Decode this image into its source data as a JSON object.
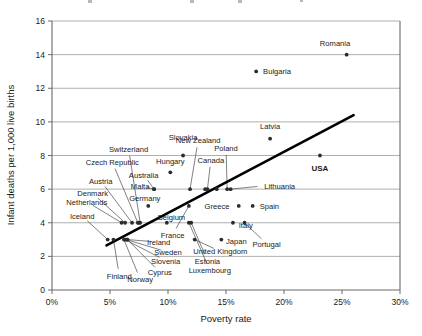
{
  "chart_data": {
    "type": "scatter",
    "title": "",
    "xlabel": "Poverty rate",
    "ylabel": "Infant deaths per 1,000 live births",
    "xlim": [
      0,
      30
    ],
    "ylim": [
      0,
      16
    ],
    "xticks": [
      "0%",
      "5%",
      "10%",
      "15%",
      "20%",
      "25%",
      "30%"
    ],
    "xtick_values": [
      0,
      5,
      10,
      15,
      20,
      25,
      30
    ],
    "yticks": [
      "0",
      "2",
      "4",
      "6",
      "8",
      "10",
      "12",
      "14",
      "16"
    ],
    "ytick_values": [
      0,
      2,
      4,
      6,
      8,
      10,
      12,
      14,
      16
    ],
    "grid": "horizontal",
    "legend": "none",
    "trendline": {
      "x0": 4.7,
      "y0": 2.65,
      "x1": 26.0,
      "y1": 10.4
    },
    "points": [
      {
        "label": "Romania",
        "x": 25.4,
        "y": 14,
        "lx": 24.4,
        "ly": 14.7,
        "anchor": "middle",
        "leader": false,
        "bold": false
      },
      {
        "label": "Bulgaria",
        "x": 17.6,
        "y": 13,
        "lx": 18.2,
        "ly": 13.0,
        "anchor": "start",
        "leader": false,
        "bold": false
      },
      {
        "label": "Latvia",
        "x": 18.8,
        "y": 9,
        "lx": 18.8,
        "ly": 9.75,
        "anchor": "middle",
        "leader": false,
        "bold": false
      },
      {
        "label": "USA",
        "x": 23.1,
        "y": 8,
        "lx": 23.1,
        "ly": 7.25,
        "anchor": "middle",
        "leader": false,
        "bold": true
      },
      {
        "label": "Slovakia",
        "x": 11.3,
        "y": 8,
        "lx": 11.3,
        "ly": 9.1,
        "anchor": "middle",
        "leader": false,
        "bold": false
      },
      {
        "label": "Hungary",
        "x": 10.2,
        "y": 7,
        "lx": 10.2,
        "ly": 7.7,
        "anchor": "middle",
        "leader": false,
        "bold": false
      },
      {
        "label": "Switzerland",
        "x": 7.6,
        "y": 4,
        "lx": 6.6,
        "ly": 8.4,
        "anchor": "middle",
        "leader": true,
        "bold": false
      },
      {
        "label": "New Zealand",
        "x": 11.9,
        "y": 6,
        "lx": 12.6,
        "ly": 8.9,
        "anchor": "middle",
        "leader": true,
        "bold": false
      },
      {
        "label": "Canada",
        "x": 13.4,
        "y": 6,
        "lx": 13.7,
        "ly": 7.75,
        "anchor": "middle",
        "leader": true,
        "bold": false
      },
      {
        "label": "Poland",
        "x": 15.1,
        "y": 6,
        "lx": 15.0,
        "ly": 8.45,
        "anchor": "middle",
        "leader": true,
        "bold": false
      },
      {
        "label": "Czech Republic",
        "x": 7.4,
        "y": 4,
        "lx": 5.2,
        "ly": 7.6,
        "anchor": "middle",
        "leader": true,
        "bold": false
      },
      {
        "label": "Australia",
        "x": 8.8,
        "y": 6,
        "lx": 7.9,
        "ly": 6.85,
        "anchor": "middle",
        "leader": true,
        "bold": false
      },
      {
        "label": "Malta",
        "x": 8.8,
        "y": 6,
        "lx": 7.6,
        "ly": 6.2,
        "anchor": "middle",
        "leader": true,
        "bold": false
      },
      {
        "label": "Austria",
        "x": 6.9,
        "y": 4,
        "lx": 4.2,
        "ly": 6.5,
        "anchor": "middle",
        "leader": true,
        "bold": false
      },
      {
        "label": "Germany",
        "x": 8.3,
        "y": 5,
        "lx": 8.0,
        "ly": 5.45,
        "anchor": "middle",
        "leader": true,
        "bold": false
      },
      {
        "label": "Denmark",
        "x": 6.3,
        "y": 4,
        "lx": 3.5,
        "ly": 5.75,
        "anchor": "middle",
        "leader": true,
        "bold": false
      },
      {
        "label": "Netherlands",
        "x": 6.0,
        "y": 4,
        "lx": 3.0,
        "ly": 5.25,
        "anchor": "middle",
        "leader": true,
        "bold": false
      },
      {
        "label": "Lithuania",
        "x": 15.4,
        "y": 6,
        "lx": 18.3,
        "ly": 6.2,
        "anchor": "start",
        "leader": true,
        "bold": false
      },
      {
        "label": "Iceland",
        "x": 4.8,
        "y": 3,
        "lx": 2.6,
        "ly": 4.4,
        "anchor": "middle",
        "leader": true,
        "bold": false
      },
      {
        "label": "Belgium",
        "x": 9.9,
        "y": 4,
        "lx": 10.3,
        "ly": 4.35,
        "anchor": "middle",
        "leader": true,
        "bold": false
      },
      {
        "label": "Greece",
        "x": 16.1,
        "y": 5,
        "lx": 15.3,
        "ly": 5.0,
        "anchor": "end",
        "leader": false,
        "bold": false
      },
      {
        "label": "Spain",
        "x": 17.3,
        "y": 5,
        "lx": 17.9,
        "ly": 5.0,
        "anchor": "start",
        "leader": false,
        "bold": false
      },
      {
        "label": "France",
        "x": 11.8,
        "y": 5,
        "lx": 10.4,
        "ly": 3.3,
        "anchor": "middle",
        "leader": true,
        "bold": false
      },
      {
        "label": "Italy",
        "x": 15.6,
        "y": 4,
        "lx": 16.1,
        "ly": 3.85,
        "anchor": "start",
        "leader": false,
        "bold": false
      },
      {
        "label": "Ireland",
        "x": 6.5,
        "y": 3,
        "lx": 9.2,
        "ly": 2.85,
        "anchor": "middle",
        "leader": true,
        "bold": false
      },
      {
        "label": "Japan",
        "x": 14.6,
        "y": 3,
        "lx": 15.0,
        "ly": 2.9,
        "anchor": "start",
        "leader": false,
        "bold": false
      },
      {
        "label": "Portugal",
        "x": 16.6,
        "y": 4,
        "lx": 18.5,
        "ly": 2.75,
        "anchor": "middle",
        "leader": true,
        "bold": false
      },
      {
        "label": "Sweden",
        "x": 6.4,
        "y": 3,
        "lx": 10.0,
        "ly": 2.25,
        "anchor": "middle",
        "leader": true,
        "bold": false
      },
      {
        "label": "United Kingdom",
        "x": 12.3,
        "y": 3,
        "lx": 14.5,
        "ly": 2.3,
        "anchor": "middle",
        "leader": true,
        "bold": false
      },
      {
        "label": "Slovenia",
        "x": 6.3,
        "y": 3,
        "lx": 9.8,
        "ly": 1.75,
        "anchor": "middle",
        "leader": true,
        "bold": false
      },
      {
        "label": "Estonia",
        "x": 12.0,
        "y": 4,
        "lx": 13.4,
        "ly": 1.75,
        "anchor": "middle",
        "leader": true,
        "bold": false
      },
      {
        "label": "Cyprus",
        "x": 6.5,
        "y": 3,
        "lx": 9.3,
        "ly": 1.05,
        "anchor": "middle",
        "leader": true,
        "bold": false
      },
      {
        "label": "Luxembourg",
        "x": 11.8,
        "y": 4,
        "lx": 13.6,
        "ly": 1.2,
        "anchor": "middle",
        "leader": true,
        "bold": false
      },
      {
        "label": "Finland",
        "x": 5.3,
        "y": 3,
        "lx": 5.8,
        "ly": 0.85,
        "anchor": "middle",
        "leader": true,
        "bold": false
      },
      {
        "label": "Norway",
        "x": 6.2,
        "y": 3,
        "lx": 7.6,
        "ly": 0.65,
        "anchor": "middle",
        "leader": true,
        "bold": false
      }
    ],
    "extra_points": [
      {
        "x": 7.5,
        "y": 4
      },
      {
        "x": 13.2,
        "y": 6
      },
      {
        "x": 14.2,
        "y": 6
      }
    ]
  }
}
